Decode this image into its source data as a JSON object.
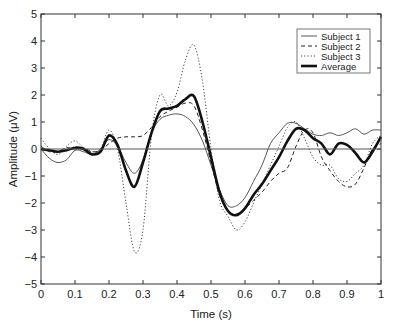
{
  "chart_data": {
    "type": "line",
    "title": "",
    "xlabel": "Time (s)",
    "ylabel": "Amplitude (μV)",
    "xlim": [
      0,
      1
    ],
    "ylim": [
      -5,
      5
    ],
    "xticks": [
      "0",
      "0.1",
      "0.2",
      "0.3",
      "0.4",
      "0.5",
      "0.6",
      "0.7",
      "0.8",
      "0.9",
      "1"
    ],
    "yticks": [
      "5",
      "4",
      "3",
      "2",
      "1",
      "0",
      "−1",
      "−2",
      "−3",
      "−4",
      "−5"
    ],
    "grid": false,
    "legend_position": "upper right",
    "zero_line": true,
    "x": [
      0,
      0.025,
      0.05,
      0.075,
      0.1,
      0.125,
      0.15,
      0.175,
      0.2,
      0.225,
      0.25,
      0.275,
      0.3,
      0.325,
      0.35,
      0.375,
      0.4,
      0.425,
      0.45,
      0.475,
      0.5,
      0.525,
      0.55,
      0.575,
      0.6,
      0.625,
      0.65,
      0.675,
      0.7,
      0.725,
      0.75,
      0.775,
      0.8,
      0.825,
      0.85,
      0.875,
      0.9,
      0.925,
      0.95,
      0.975,
      1.0
    ],
    "series": [
      {
        "name": "Subject 1",
        "style": "thin-solid",
        "values": [
          0,
          -0.35,
          -0.5,
          -0.4,
          -0.05,
          -0.1,
          -0.2,
          0.0,
          0.35,
          0.1,
          -0.5,
          -0.9,
          -0.4,
          0.6,
          1.1,
          1.25,
          1.3,
          1.2,
          0.9,
          0.3,
          -0.6,
          -1.5,
          -2.1,
          -2.1,
          -1.8,
          -1.2,
          -0.6,
          0.2,
          0.6,
          0.95,
          0.95,
          0.75,
          0.55,
          0.5,
          0.6,
          0.5,
          0.6,
          0.75,
          0.55,
          0.7,
          0.7
        ]
      },
      {
        "name": "Subject 2",
        "style": "dashed",
        "values": [
          0.1,
          -0.1,
          -0.1,
          0.05,
          0.0,
          0.05,
          -0.1,
          -0.05,
          0.2,
          0.4,
          0.45,
          0.45,
          0.5,
          0.8,
          1.2,
          1.4,
          1.55,
          1.7,
          1.6,
          0.7,
          -0.5,
          -1.7,
          -2.3,
          -2.4,
          -2.2,
          -1.9,
          -1.6,
          -1.2,
          -0.9,
          -0.7,
          0.1,
          0.7,
          0.6,
          -0.3,
          -0.8,
          -1.2,
          -1.4,
          -1.3,
          -0.7,
          0.0,
          0.2
        ]
      },
      {
        "name": "Subject 3",
        "style": "dotted",
        "values": [
          0.4,
          0.0,
          -0.2,
          0.1,
          0.3,
          0.05,
          -0.1,
          0.0,
          0.7,
          0.0,
          -2.0,
          -3.8,
          -3.0,
          0.5,
          2.0,
          1.6,
          2.1,
          3.3,
          3.85,
          2.5,
          0.0,
          -1.9,
          -2.5,
          -3.0,
          -2.7,
          -2.0,
          -1.3,
          -0.6,
          0.1,
          0.8,
          1.0,
          0.4,
          -0.3,
          -0.6,
          -0.6,
          -1.1,
          -1.2,
          -0.9,
          -0.6,
          0.2,
          0.5
        ]
      },
      {
        "name": "Average",
        "style": "thick-solid",
        "values": [
          0,
          -0.05,
          -0.1,
          -0.05,
          0.05,
          0.0,
          -0.2,
          -0.1,
          0.5,
          0.15,
          -0.8,
          -1.4,
          -0.5,
          0.6,
          1.4,
          1.5,
          1.6,
          1.85,
          1.95,
          1.0,
          -0.3,
          -1.6,
          -2.3,
          -2.45,
          -2.2,
          -1.7,
          -1.3,
          -0.8,
          -0.3,
          0.3,
          0.75,
          0.7,
          0.4,
          0.2,
          -0.2,
          0.2,
          0.15,
          -0.15,
          -0.5,
          -0.1,
          0.45
        ]
      }
    ]
  }
}
